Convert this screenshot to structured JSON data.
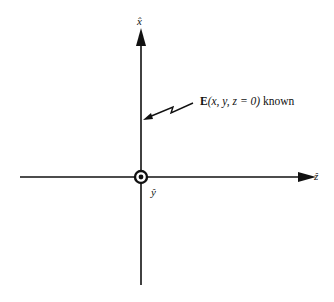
{
  "diagram": {
    "axes": {
      "x_label": "x̂",
      "z_label": "ẑ",
      "y_label": "ŷ",
      "y_direction": "out-of-page (circled dot)"
    },
    "annotation": {
      "field_symbol": "E",
      "args": "(x, y, z = 0)",
      "suffix": " known"
    },
    "colors": {
      "stroke": "#111111",
      "background": "#ffffff"
    }
  }
}
